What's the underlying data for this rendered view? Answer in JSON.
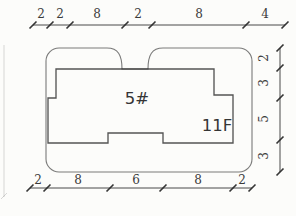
{
  "drawing": {
    "building_label": "5#",
    "floor_label": "11F"
  },
  "dimensions": {
    "top": [
      "2",
      "2",
      "8",
      "2",
      "8",
      "4"
    ],
    "right": [
      "2",
      "3",
      "5",
      "3"
    ],
    "bottom": [
      "2",
      "8",
      "6",
      "8",
      "2"
    ]
  },
  "colors": {
    "ink": "#2b2b2b",
    "paper": "#fcfcfa"
  }
}
